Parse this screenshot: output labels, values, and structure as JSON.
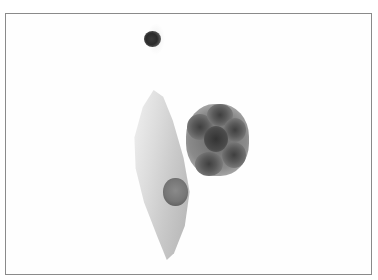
{
  "image": {
    "type": "micrograph",
    "colors": {
      "background": "#ffffff",
      "frame_border": "#8a8a8a",
      "nucleus_dark": "#3a3a3a",
      "cytoplasm_light": "#d8d8d8"
    }
  }
}
